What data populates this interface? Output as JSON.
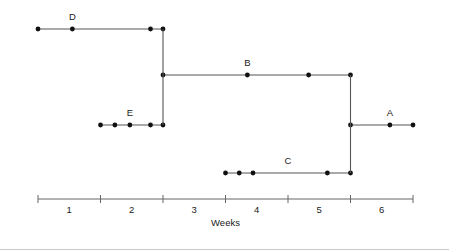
{
  "chart_data": {
    "type": "line",
    "title": "",
    "subtitle": "",
    "xlabel": "Weeks",
    "ylabel": "",
    "xlim": [
      0.5,
      6.5
    ],
    "xticks": [
      0.5,
      1.5,
      2.5,
      3.5,
      4.5,
      5.5,
      6.5
    ],
    "xtick_labels": [
      "1",
      "2",
      "3",
      "4",
      "5",
      "6"
    ],
    "xtick_label_positions": [
      1,
      2,
      3,
      4,
      5,
      6
    ],
    "grid": false,
    "legend": "none",
    "colors": {
      "line": "#555555",
      "marker": "#111111",
      "axis": "#666666",
      "text": "#1a1a1a",
      "background": "#ffffff"
    },
    "levels": {
      "D": 4,
      "B": 3,
      "E": 2,
      "A": 2,
      "C": 1
    },
    "series": [
      {
        "name": "D",
        "label": "D",
        "level": 4,
        "x_start": 0.5,
        "x_end": 2.5,
        "points": [
          0.5,
          1.05,
          2.3,
          2.5
        ],
        "label_x": 1.05
      },
      {
        "name": "B",
        "label": "B",
        "level": 3,
        "x_start": 2.5,
        "x_end": 5.5,
        "points": [
          2.5,
          3.85,
          4.83,
          5.5
        ],
        "label_x": 3.85
      },
      {
        "name": "E",
        "label": "E",
        "level": 2,
        "x_start": 1.5,
        "x_end": 2.5,
        "points": [
          1.5,
          1.73,
          1.97,
          2.3,
          2.5
        ],
        "label_x": 1.97
      },
      {
        "name": "A",
        "label": "A",
        "level": 2,
        "x_start": 5.5,
        "x_end": 6.5,
        "points": [
          5.5,
          6.13,
          6.5
        ],
        "label_x": 6.13
      },
      {
        "name": "C",
        "label": "C",
        "level": 1,
        "x_start": 3.5,
        "x_end": 5.5,
        "points": [
          3.5,
          3.72,
          3.94,
          5.13,
          5.5
        ],
        "label_x": 4.5
      }
    ],
    "connectors": [
      {
        "name": "connector-d-e",
        "x": 2.5,
        "from_level": 4,
        "to_level": 2
      },
      {
        "name": "connector-b-c",
        "x": 5.5,
        "from_level": 3,
        "to_level": 1
      }
    ],
    "annotations": [
      {
        "text": "D",
        "x": 1.05,
        "level": 4
      },
      {
        "text": "B",
        "x": 3.85,
        "level": 3
      },
      {
        "text": "E",
        "x": 1.97,
        "level": 2
      },
      {
        "text": "A",
        "x": 6.13,
        "level": 2
      },
      {
        "text": "C",
        "x": 4.5,
        "level": 1
      }
    ]
  }
}
